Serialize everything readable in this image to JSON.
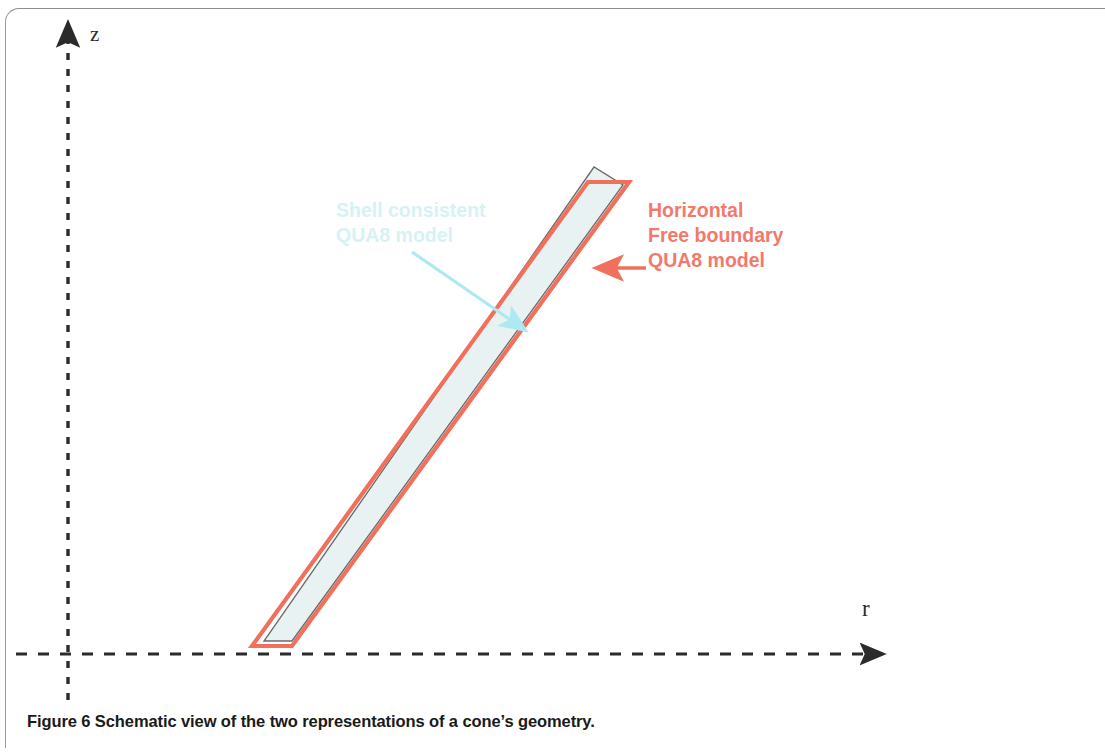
{
  "figure": {
    "caption": "Figure 6 Schematic view of the two representations of a cone’s geometry.",
    "axes": {
      "vertical_label": "z",
      "horizontal_label": "r",
      "style": "dashed",
      "color": "#2b2b2b"
    },
    "annotations": [
      {
        "name": "red-callout",
        "text": "Horizontal\nFree boundary\nQUA8 model",
        "color": "#F2796B",
        "arrow": {
          "from_x": 646,
          "from_y": 268,
          "to_x": 595,
          "to_y": 268
        }
      },
      {
        "name": "blue-callout",
        "text": "Shell consistent\nQUA8 model",
        "color": "#D6F2F5",
        "arrow": {
          "from_x": 412,
          "from_y": 252,
          "to_x": 527,
          "to_y": 331
        }
      }
    ],
    "shapes": {
      "outer_model": {
        "name": "horizontal-free-boundary-quad8-outline",
        "stroke": "#F0705C",
        "fill": "none",
        "points": "252,646 292,646 629,182 588,182"
      },
      "inner_model": {
        "name": "shell-consistent-quad8-outline",
        "stroke": "#6b6b6b",
        "fill": "#E8F2F2",
        "points": "264,641 292,641 623,185 594,167"
      }
    },
    "colors": {
      "red": "#F0705C",
      "red_text": "#F2796B",
      "cyan": "#AEE9F2",
      "cyan_text": "#D6F2F5",
      "shell_fill": "#E8F2F2",
      "shell_stroke": "#6b6b6b",
      "axis": "#2b2b2b",
      "caption": "#1a1a1a",
      "page_rule": "#9a9a9a"
    }
  }
}
